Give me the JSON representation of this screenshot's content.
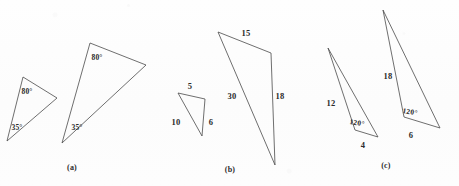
{
  "figure": {
    "background_color": "#fdfdfd",
    "stroke_color": "#4a4a4a",
    "text_color": "#2b2b2b"
  },
  "panels": [
    {
      "caption": "(a)",
      "caption_pos": {
        "x": 72,
        "y": 168
      },
      "shapes": [
        {
          "name": "small-triangle-a",
          "points": "23,77 57,98 7,141",
          "labels": [
            {
              "text": "80°",
              "x": 27,
              "y": 92,
              "kind": "angle",
              "rot": ""
            },
            {
              "text": "35°",
              "x": 17,
              "y": 128,
              "kind": "angle",
              "rot": ""
            }
          ]
        },
        {
          "name": "large-triangle-a",
          "points": "90,43 146,65 62,143",
          "labels": [
            {
              "text": "80°",
              "x": 97,
              "y": 58,
              "kind": "angle",
              "rot": ""
            },
            {
              "text": "35°",
              "x": 77,
              "y": 128,
              "kind": "angle",
              "rot": ""
            }
          ]
        }
      ]
    },
    {
      "caption": "(b)",
      "caption_pos": {
        "x": 230,
        "y": 170
      },
      "shapes": [
        {
          "name": "small-triangle-b",
          "points": "178,93 205,99 202,136",
          "labels": [
            {
              "text": "5",
              "x": 190,
              "y": 86,
              "kind": "side",
              "rot": ""
            },
            {
              "text": "10",
              "x": 176,
              "y": 122,
              "kind": "side",
              "rot": ""
            },
            {
              "text": "6",
              "x": 211,
              "y": 122,
              "kind": "side",
              "rot": ""
            }
          ]
        },
        {
          "name": "large-triangle-b",
          "points": "218,32 271,53 275,165",
          "labels": [
            {
              "text": "15",
              "x": 246,
              "y": 33,
              "kind": "side",
              "rot": ""
            },
            {
              "text": "30",
              "x": 232,
              "y": 96,
              "kind": "side",
              "rot": ""
            },
            {
              "text": "18",
              "x": 280,
              "y": 96,
              "kind": "side",
              "rot": ""
            }
          ]
        }
      ]
    },
    {
      "caption": "(c)",
      "caption_pos": {
        "x": 386,
        "y": 166
      },
      "shapes": [
        {
          "name": "small-triangle-c",
          "points": "328,48 355,130 378,137",
          "labels": [
            {
              "text": "12",
              "x": 331,
              "y": 103,
              "kind": "side",
              "rot": ""
            },
            {
              "text": "120°",
              "x": 357,
              "y": 123,
              "kind": "angle",
              "rot": "rot-pos10"
            },
            {
              "text": "4",
              "x": 363,
              "y": 145,
              "kind": "side",
              "rot": ""
            }
          ]
        },
        {
          "name": "large-triangle-c",
          "points": "383,10 404,117 440,128",
          "labels": [
            {
              "text": "18",
              "x": 388,
              "y": 76,
              "kind": "side",
              "rot": ""
            },
            {
              "text": "120°",
              "x": 410,
              "y": 112,
              "kind": "angle",
              "rot": "rot-pos10"
            },
            {
              "text": "6",
              "x": 411,
              "y": 135,
              "kind": "side",
              "rot": ""
            }
          ]
        }
      ]
    }
  ],
  "chart_data": {
    "type": "diagram",
    "panels": [
      {
        "label": "(a)",
        "relationship": "AA similarity — two pairs of congruent angles",
        "small": {
          "angles": [
            "80°",
            "35°"
          ]
        },
        "large": {
          "angles": [
            "80°",
            "35°"
          ]
        }
      },
      {
        "label": "(b)",
        "relationship": "SSS similarity — ratio 1:3",
        "small": {
          "sides": [
            5,
            10,
            6
          ]
        },
        "large": {
          "sides": [
            15,
            30,
            18
          ]
        }
      },
      {
        "label": "(c)",
        "relationship": "SAS similarity — ratio 2:3 with included 120°",
        "small": {
          "sides": [
            12,
            4
          ],
          "included_angle": "120°"
        },
        "large": {
          "sides": [
            18,
            6
          ],
          "included_angle": "120°"
        }
      }
    ]
  }
}
